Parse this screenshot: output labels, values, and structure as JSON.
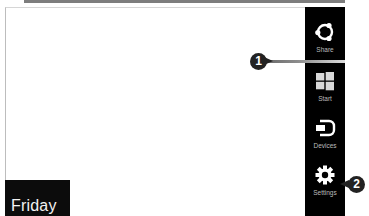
{
  "screen": {
    "day_label": "Friday"
  },
  "charms": {
    "items": [
      {
        "id": "share",
        "label": "Share",
        "icon": "share-icon"
      },
      {
        "id": "start",
        "label": "Start",
        "icon": "windows-logo-icon"
      },
      {
        "id": "devices",
        "label": "Devices",
        "icon": "devices-icon"
      },
      {
        "id": "settings",
        "label": "Settings",
        "icon": "gear-icon"
      }
    ]
  },
  "callouts": {
    "one": "1",
    "two": "2"
  },
  "colors": {
    "charms_bar": "#000000",
    "charm_label": "#bcbcbc",
    "day_tile": "#0c0c0c",
    "callout": "#222222",
    "background": "#ffffff"
  }
}
